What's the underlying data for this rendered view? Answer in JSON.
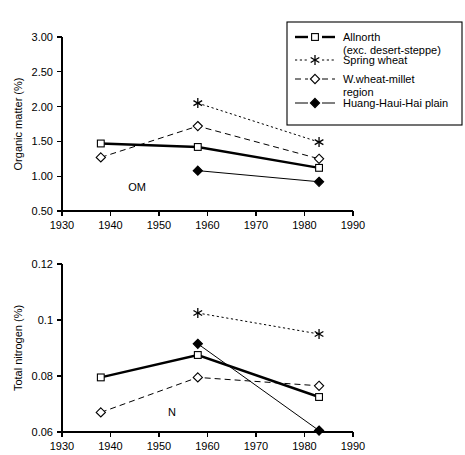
{
  "figure": {
    "title": "",
    "panels": [
      "organic-matter",
      "total-nitrogen"
    ]
  },
  "legend": {
    "position": "top-right",
    "entries": [
      {
        "label_line1": "Allnorth",
        "label_line2": "(exc. desert-steppe)",
        "marker": "open-square",
        "line": "solid-thick"
      },
      {
        "label_line1": "Spring wheat",
        "label_line2": "",
        "marker": "star",
        "line": "dotted"
      },
      {
        "label_line1": "W.wheat-millet",
        "label_line2": "region",
        "marker": "open-diamond",
        "line": "dashed"
      },
      {
        "label_line1": "Huang-Haui-Hai plain",
        "label_line2": "",
        "marker": "solid-diamond",
        "line": "solid-thin"
      }
    ]
  },
  "chart_data": [
    {
      "id": "organic-matter",
      "type": "line",
      "title": "",
      "annotation": "OM",
      "xlabel": "",
      "ylabel": "Organic matter (%)",
      "xlim": [
        1930,
        1990
      ],
      "ylim": [
        0.5,
        3.0
      ],
      "xticks": [
        1930,
        1940,
        1950,
        1960,
        1970,
        1980,
        1990
      ],
      "xtick_labels": [
        "1930",
        "1940",
        "1950",
        "1960",
        "1970",
        "1980",
        "1990"
      ],
      "yticks": [
        0.5,
        1.0,
        1.5,
        2.0,
        2.5,
        3.0
      ],
      "ytick_labels": [
        "0.50",
        "1.00",
        "1.50",
        "2.00",
        "2.50",
        "3.00"
      ],
      "grid": false,
      "series": [
        {
          "name": "Allnorth (exc. desert-steppe)",
          "marker": "open-square",
          "line": "solid-thick",
          "x": [
            1938,
            1958,
            1983
          ],
          "values": [
            1.47,
            1.42,
            1.12
          ]
        },
        {
          "name": "Spring wheat",
          "marker": "star",
          "line": "dotted",
          "x": [
            1958,
            1983
          ],
          "values": [
            2.05,
            1.49
          ]
        },
        {
          "name": "W.wheat-millet region",
          "marker": "open-diamond",
          "line": "dashed",
          "x": [
            1938,
            1958,
            1983
          ],
          "values": [
            1.27,
            1.72,
            1.25
          ]
        },
        {
          "name": "Huang-Haui-Hai plain",
          "marker": "solid-diamond",
          "line": "solid-thin",
          "x": [
            1958,
            1983
          ],
          "values": [
            1.08,
            0.92
          ]
        }
      ]
    },
    {
      "id": "total-nitrogen",
      "type": "line",
      "title": "",
      "annotation": "N",
      "xlabel": "",
      "ylabel": "Total nitrogen (%)",
      "xlim": [
        1930,
        1990
      ],
      "ylim": [
        0.06,
        0.12
      ],
      "xticks": [
        1930,
        1940,
        1950,
        1960,
        1970,
        1980,
        1990
      ],
      "xtick_labels": [
        "1930",
        "1940",
        "1950",
        "1960",
        "1970",
        "1980",
        "1990"
      ],
      "yticks": [
        0.06,
        0.08,
        0.1,
        0.12
      ],
      "ytick_labels": [
        "0.06",
        "0.08",
        "0.1",
        "0.12"
      ],
      "grid": false,
      "series": [
        {
          "name": "Allnorth (exc. desert-steppe)",
          "marker": "open-square",
          "line": "solid-thick",
          "x": [
            1938,
            1958,
            1983
          ],
          "values": [
            0.0795,
            0.0875,
            0.0725
          ]
        },
        {
          "name": "Spring wheat",
          "marker": "star",
          "line": "dotted",
          "x": [
            1958,
            1983
          ],
          "values": [
            0.1025,
            0.095
          ]
        },
        {
          "name": "W.wheat-millet region",
          "marker": "open-diamond",
          "line": "dashed",
          "x": [
            1938,
            1958,
            1983
          ],
          "values": [
            0.067,
            0.0795,
            0.0765
          ]
        },
        {
          "name": "Huang-Haui-Hai plain",
          "marker": "solid-diamond",
          "line": "solid-thin",
          "x": [
            1958,
            1983
          ],
          "values": [
            0.0915,
            0.0605
          ]
        }
      ]
    }
  ]
}
